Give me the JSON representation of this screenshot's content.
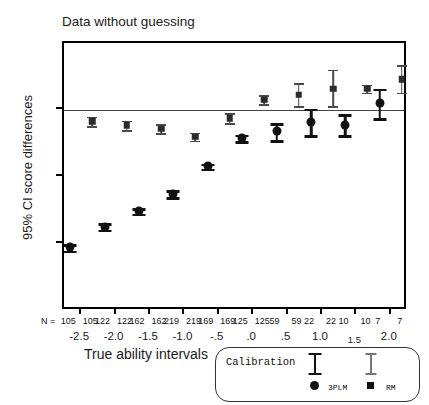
{
  "chart_data": {
    "type": "scatter",
    "title": "Data without guessing",
    "xlabel": "True ability intervals",
    "ylabel": "95% CI score differences",
    "ylim": [
      -30,
      10
    ],
    "yticks": [
      10,
      0,
      -10,
      -20,
      -30
    ],
    "ytick_labels": [
      "10",
      "0",
      "-10",
      "-20",
      "-30"
    ],
    "grid": false,
    "zero_reference_line": true,
    "legend_position": "bottom-right",
    "categories": [
      "-2.5",
      "-2.0",
      "-1.5",
      "-1.0",
      "-.5",
      ".0",
      ".5",
      "1.0",
      "1.5",
      "2.0"
    ],
    "n_prefix": "N =",
    "n_counts": [
      {
        "threepl": "105",
        "rm": "105"
      },
      {
        "threepl": "122",
        "rm": "122"
      },
      {
        "threepl": "162",
        "rm": "162"
      },
      {
        "threepl": "219",
        "rm": "219"
      },
      {
        "threepl": "169",
        "rm": "169"
      },
      {
        "threepl": "125",
        "rm": "125"
      },
      {
        "threepl": "59",
        "rm": "59"
      },
      {
        "threepl": "22",
        "rm": "22"
      },
      {
        "threepl": "10",
        "rm": "10"
      },
      {
        "threepl": "7",
        "rm": "7"
      }
    ],
    "series": [
      {
        "name": "3PLM",
        "marker": "circle",
        "color": "#111111",
        "values": [
          -20.5,
          -17.4,
          -15.1,
          -12.5,
          -8.4,
          -4.2,
          -3.2,
          -1.8,
          -2.2,
          1.0
        ],
        "ci_low": [
          -21.0,
          -17.9,
          -15.5,
          -13.0,
          -8.8,
          -4.7,
          -4.5,
          -3.8,
          -3.8,
          -1.2
        ],
        "ci_high": [
          -20.0,
          -16.9,
          -14.7,
          -12.0,
          -8.0,
          -3.7,
          -2.0,
          0.2,
          -0.6,
          3.2
        ]
      },
      {
        "name": "RM",
        "marker": "square",
        "color": "#2b2b2b",
        "values": [
          -1.7,
          -2.3,
          -2.8,
          -4.0,
          -1.2,
          1.5,
          2.3,
          3.2,
          3.2,
          4.6
        ],
        "ci_low": [
          -2.4,
          -3.0,
          -3.5,
          -4.6,
          -2.0,
          0.9,
          0.6,
          0.6,
          2.6,
          2.6
        ],
        "ci_high": [
          -1.0,
          -1.6,
          -2.1,
          -3.4,
          -0.5,
          2.2,
          4.0,
          6.0,
          3.8,
          6.7
        ]
      }
    ],
    "legend": {
      "title": "Calibration",
      "entries": [
        {
          "label": "3PLM",
          "marker": "circle"
        },
        {
          "label": "RM",
          "marker": "square"
        }
      ]
    }
  }
}
